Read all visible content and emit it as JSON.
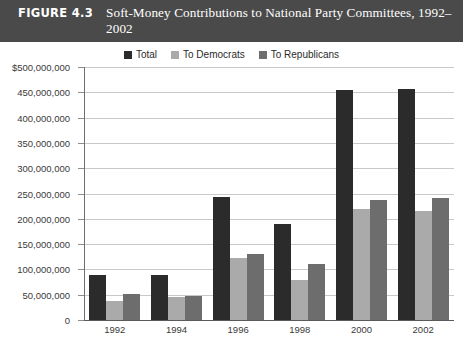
{
  "figure": {
    "number": "FIGURE 4.3",
    "title": "Soft-Money Contributions to National Party Committees, 1992–2002"
  },
  "colors": {
    "total": "#2b2b2b",
    "democrats": "#aaaaaa",
    "republicans": "#6d6d6d",
    "title_bar_bg": "#4a4a4a",
    "gridline": "#c9c9c9",
    "axis": "#5a5a5a"
  },
  "legend": {
    "position": "top-center",
    "entries": [
      {
        "label": "Total",
        "color": "#2b2b2b"
      },
      {
        "label": "To Democrats",
        "color": "#aaaaaa"
      },
      {
        "label": "To Republicans",
        "color": "#6d6d6d"
      }
    ]
  },
  "chart_data": {
    "type": "bar",
    "title": "Soft-Money Contributions to National Party Committees, 1992–2002",
    "xlabel": "",
    "ylabel": "",
    "categories": [
      "1992",
      "1994",
      "1996",
      "1998",
      "2000",
      "2002"
    ],
    "series": [
      {
        "name": "Total",
        "color": "#2b2b2b",
        "values": [
          88000000,
          88000000,
          243000000,
          190000000,
          455000000,
          457000000
        ]
      },
      {
        "name": "To Democrats",
        "color": "#aaaaaa",
        "values": [
          37000000,
          45000000,
          122000000,
          80000000,
          220000000,
          216000000
        ]
      },
      {
        "name": "To Republicans",
        "color": "#6d6d6d",
        "values": [
          52000000,
          48000000,
          130000000,
          110000000,
          238000000,
          242000000
        ]
      }
    ],
    "ylim": [
      0,
      500000000
    ],
    "ytick_values": [
      0,
      50000000,
      100000000,
      150000000,
      200000000,
      250000000,
      300000000,
      350000000,
      400000000,
      450000000,
      500000000
    ],
    "ytick_labels": [
      "0",
      "50,000,000",
      "100,000,000",
      "150,000,000",
      "200,000,000",
      "250,000,000",
      "300,000,000",
      "350,000,000",
      "400,000,000",
      "450,000,000",
      "$500,000,000"
    ],
    "grid": true,
    "legend_position": "top-center"
  }
}
